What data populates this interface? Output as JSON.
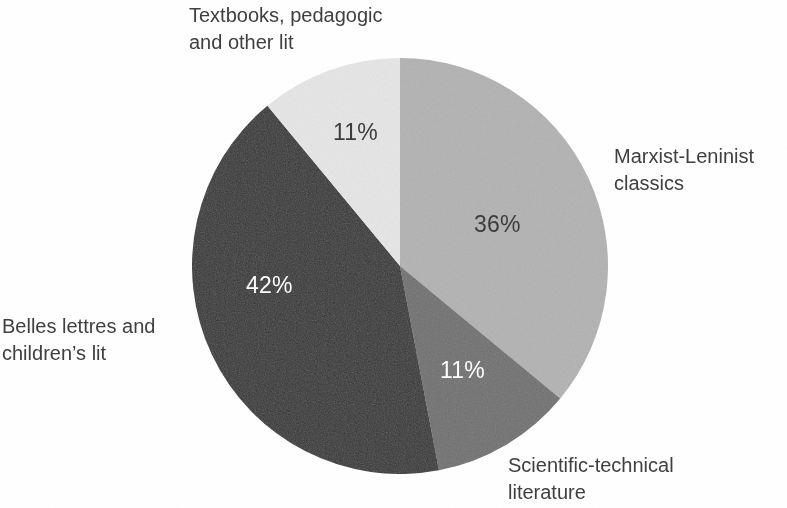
{
  "chart_data": {
    "type": "pie",
    "title": "",
    "subtitle": "",
    "xlabel": "",
    "ylabel": "",
    "legend_position": "none",
    "grid": false,
    "value_unit": "%",
    "start_angle_deg": 0,
    "direction": "clockwise",
    "categories": [
      "Marxist-Leninist classics",
      "Scientific-technical literature",
      "Belles lettres and children’s lit",
      "Textbooks, pedagogic and other lit"
    ],
    "values": [
      36,
      11,
      42,
      11
    ],
    "labels": [
      "36%",
      "11%",
      "42%",
      "11%"
    ],
    "colors": [
      "#b3b3b3",
      "#6f6f6f",
      "#333333",
      "#e7e7e7"
    ],
    "slices": [
      {
        "key": "marxist",
        "name": "Marxist-Leninist classics",
        "name_line1": "Marxist-Leninist",
        "name_line2": "classics",
        "value": 36,
        "value_label": "36%",
        "color": "#b3b3b3",
        "label_text_color": "#3c3c3c"
      },
      {
        "key": "scientific",
        "name": "Scientific-technical literature",
        "name_line1": "Scientific-technical",
        "name_line2": "literature",
        "value": 11,
        "value_label": "11%",
        "color": "#6f6f6f",
        "label_text_color": "#ffffff"
      },
      {
        "key": "belles",
        "name": "Belles lettres and children’s lit",
        "name_line1": "Belles lettres and",
        "name_line2": "children’s lit",
        "value": 42,
        "value_label": "42%",
        "color": "#333333",
        "label_text_color": "#ffffff"
      },
      {
        "key": "textbooks",
        "name": "Textbooks, pedagogic and other lit",
        "name_line1": "Textbooks, pedagogic",
        "name_line2": "and other lit",
        "value": 11,
        "value_label": "11%",
        "color": "#e7e7e7",
        "label_text_color": "#3c3c3c"
      }
    ]
  },
  "labels": {
    "marxist": "Marxist-Leninist\nclassics",
    "scientific": "Scientific-technical\nliterature",
    "belles": "Belles lettres and\nchildren’s lit",
    "textbooks": "Textbooks, pedagogic\nand other lit"
  },
  "values": {
    "marxist": "36%",
    "scientific": "11%",
    "belles": "42%",
    "textbooks": "11%"
  },
  "colors": {
    "background": "#ffffff",
    "text": "#3f3f3f",
    "slice_marxist": "#b3b3b3",
    "slice_scientific": "#6f6f6f",
    "slice_belles": "#333333",
    "slice_textbooks": "#e7e7e7"
  }
}
